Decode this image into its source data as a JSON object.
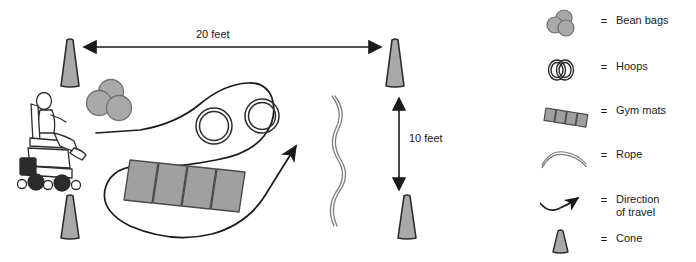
{
  "diagram": {
    "dimensions": {
      "horizontal_label": "20 feet",
      "vertical_label": "10 feet"
    },
    "colors": {
      "equipment_fill": "#a9a9a9",
      "mat_fill": "#a0a0a0",
      "outline": "#2b2b2b",
      "line": "#1a1a1a",
      "background": "#ffffff"
    },
    "elements": {
      "cone_count": 4,
      "bean_bag_count": 3,
      "hoop_count": 2,
      "gym_mat_panel_count": 4,
      "rope_count": 1,
      "path_count": 1
    }
  },
  "legend": {
    "equals": "=",
    "items": [
      {
        "icon": "bean-bags-icon",
        "label": "Bean bags",
        "label2": ""
      },
      {
        "icon": "hoops-icon",
        "label": "Hoops",
        "label2": ""
      },
      {
        "icon": "gym-mats-icon",
        "label": "Gym mats",
        "label2": ""
      },
      {
        "icon": "rope-icon",
        "label": "Rope",
        "label2": ""
      },
      {
        "icon": "direction-of-travel-icon",
        "label": "Direction",
        "label2": "of travel"
      },
      {
        "icon": "cone-icon",
        "label": "Cone",
        "label2": ""
      }
    ]
  }
}
